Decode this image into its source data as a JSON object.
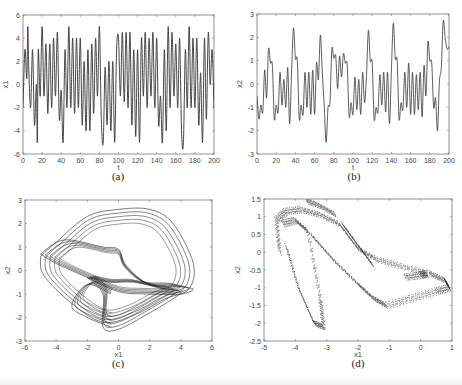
{
  "figure": {
    "captions": {
      "a": "(a)",
      "b": "(b)",
      "c": "(c)",
      "d": "(d)"
    }
  },
  "chart_data": [
    {
      "id": "a",
      "type": "line",
      "title": "",
      "xlabel": "t",
      "ylabel": "x1",
      "xlim": [
        0,
        200
      ],
      "ylim": [
        -6,
        6
      ],
      "xticks": [
        0,
        20,
        40,
        60,
        80,
        100,
        120,
        140,
        160,
        180,
        200
      ],
      "yticks": [
        -6,
        -4,
        -2,
        0,
        2,
        4,
        6
      ],
      "grid": false,
      "legend": null,
      "series": [
        {
          "name": "x1(t)",
          "x": [
            0,
            2,
            4,
            5,
            6,
            8,
            10,
            12,
            14,
            15,
            16,
            18,
            20,
            22,
            24,
            26,
            28,
            30,
            32,
            34,
            36,
            38,
            40,
            42,
            44,
            46,
            48,
            50,
            52,
            54,
            56,
            58,
            60,
            62,
            64,
            66,
            68,
            70,
            72,
            74,
            76,
            78,
            80,
            82,
            84,
            86,
            88,
            90,
            92,
            94,
            96,
            98,
            100,
            102,
            104,
            106,
            108,
            110,
            112,
            114,
            116,
            118,
            120,
            122,
            124,
            126,
            128,
            130,
            132,
            134,
            136,
            138,
            140,
            142,
            144,
            146,
            148,
            150,
            152,
            154,
            156,
            158,
            160,
            162,
            164,
            166,
            168,
            170,
            172,
            174,
            176,
            178,
            180,
            182,
            184,
            186,
            188,
            190,
            192,
            194,
            196,
            198,
            200
          ],
          "y": [
            -2,
            3,
            0.5,
            5,
            1.5,
            -2,
            3,
            -3.5,
            0,
            -5,
            3,
            -1,
            5,
            -1,
            3.5,
            -2.5,
            3.5,
            -2,
            4,
            -1,
            4.5,
            -3,
            -0.5,
            -5,
            3,
            -2,
            5,
            -2,
            4,
            -2.5,
            4,
            -2,
            4,
            -3.5,
            2,
            -4,
            3,
            -4,
            3.5,
            -2.5,
            4,
            -1,
            5,
            -3,
            -5,
            1.5,
            -3.5,
            2,
            -4,
            2,
            -5,
            3,
            4,
            -1,
            4.5,
            -1.5,
            4.5,
            -2,
            4.5,
            -3.5,
            3,
            -4.5,
            3,
            -5,
            4,
            -1,
            4.5,
            -2,
            4,
            -1,
            4.5,
            -2,
            4,
            -3.5,
            -1,
            -5,
            3,
            -4,
            5,
            -2,
            4.5,
            -1,
            3.5,
            -2,
            4,
            -4,
            -5,
            3,
            -2,
            5,
            -2,
            4,
            -2,
            4,
            -3.5,
            1,
            -5,
            4,
            -3,
            4.5,
            0,
            3,
            -2
          ]
        }
      ]
    },
    {
      "id": "b",
      "type": "line",
      "title": "",
      "xlabel": "t",
      "ylabel": "x2",
      "xlim": [
        0,
        200
      ],
      "ylim": [
        -3,
        3
      ],
      "xticks": [
        0,
        20,
        40,
        60,
        80,
        100,
        120,
        140,
        160,
        180,
        200
      ],
      "yticks": [
        -3,
        -2,
        -1,
        0,
        1,
        2,
        3
      ],
      "grid": false,
      "legend": null,
      "series": [
        {
          "name": "x2(t)",
          "x": [
            0,
            2,
            4,
            6,
            8,
            10,
            12,
            14,
            16,
            18,
            20,
            22,
            24,
            26,
            28,
            30,
            32,
            34,
            36,
            38,
            40,
            42,
            44,
            46,
            48,
            50,
            52,
            54,
            56,
            58,
            60,
            62,
            64,
            66,
            68,
            70,
            72,
            74,
            76,
            78,
            80,
            82,
            84,
            86,
            88,
            90,
            92,
            94,
            96,
            98,
            100,
            102,
            104,
            106,
            108,
            110,
            112,
            114,
            116,
            118,
            120,
            122,
            124,
            126,
            128,
            130,
            132,
            134,
            136,
            138,
            140,
            142,
            144,
            146,
            148,
            150,
            152,
            154,
            156,
            158,
            160,
            162,
            164,
            166,
            168,
            170,
            172,
            174,
            176,
            178,
            180,
            182,
            184,
            186,
            188,
            190,
            192,
            194,
            196,
            198,
            200
          ],
          "y": [
            -0.5,
            -1.5,
            -0.9,
            -1.2,
            0.6,
            -0.6,
            1.5,
            0.9,
            0.8,
            -1.5,
            -0.9,
            -1.2,
            0.5,
            -0.9,
            0.2,
            -1,
            0.7,
            -1.7,
            0.5,
            2.4,
            1.1,
            1,
            -1.5,
            -0.9,
            -1.3,
            0.5,
            -1,
            0.5,
            -1.3,
            0.6,
            -1.3,
            0.9,
            0.2,
            2.1,
            0.5,
            -0.9,
            -2.5,
            -1,
            -0.8,
            1.5,
            1.1,
            1.2,
            -0.2,
            1.2,
            0.3,
            1.3,
            0.9,
            0.8,
            -1.4,
            -0.8,
            -1.3,
            0.3,
            -1.1,
            0.2,
            -1.3,
            0.5,
            -0.8,
            0.3,
            2.3,
            1,
            0.9,
            -1.5,
            -1,
            -1.2,
            0.4,
            -0.9,
            0.5,
            -1.2,
            0.5,
            -1.7,
            0.6,
            2.6,
            1.1,
            1,
            -1.5,
            -0.8,
            -1.1,
            0.5,
            -1,
            0.9,
            -1.3,
            0.5,
            -1.3,
            0.4,
            -1.1,
            0.5,
            -1.4,
            0.8,
            -0.5,
            1.8,
            1,
            0.9,
            -1,
            -0.6,
            -2,
            0.1,
            0.7,
            2.7,
            2,
            1.5,
            1.6
          ]
        }
      ]
    },
    {
      "id": "c",
      "type": "line",
      "title": "",
      "xlabel": "x1",
      "ylabel": "x2",
      "xlim": [
        -6,
        6
      ],
      "ylim": [
        -3,
        3
      ],
      "xticks": [
        -6,
        -4,
        -2,
        0,
        2,
        4,
        6
      ],
      "yticks": [
        -3,
        -2,
        -1,
        0,
        1,
        2,
        3
      ],
      "grid": false,
      "legend": null,
      "description": "Phase portrait x2 vs x1 — chaotic multi-loop attractor spanning x1 ∈ [-5, 5], x2 ∈ [-2.5, 2.6]",
      "series": [
        {
          "name": "orbit-outer",
          "x": [
            -5,
            -4,
            -2,
            0,
            2,
            3.5,
            4.8,
            4.5,
            3,
            1,
            -1,
            -3,
            -4.8,
            -5
          ],
          "y": [
            0.6,
            1.2,
            2.3,
            2.6,
            2.6,
            2,
            0.3,
            -0.8,
            -1.2,
            -1.9,
            -2.2,
            -1.4,
            -0.2,
            0.6
          ]
        },
        {
          "name": "orbit-mid",
          "x": [
            -5,
            -3.5,
            -1,
            0,
            0.5,
            2,
            4,
            4.8,
            4,
            2,
            0,
            -2,
            -4,
            -5
          ],
          "y": [
            0.7,
            1.3,
            1,
            0.9,
            0.2,
            -0.6,
            -0.7,
            -0.8,
            -1,
            -1,
            -0.9,
            -0.3,
            0.3,
            0.7
          ]
        },
        {
          "name": "orbit-low",
          "x": [
            -2,
            -1,
            -1,
            0,
            2,
            3.5,
            4,
            3,
            1,
            -0.5,
            -2
          ],
          "y": [
            -0.3,
            -1,
            -2.4,
            -2.5,
            -1.8,
            -1.2,
            -0.9,
            -0.8,
            -0.5,
            -0.5,
            -0.3
          ]
        },
        {
          "name": "orbit-left-bulge",
          "x": [
            -0.5,
            -2,
            -3,
            -2,
            -0.5
          ],
          "y": [
            -1,
            -0.6,
            -1.5,
            -2,
            -2.4
          ]
        }
      ]
    },
    {
      "id": "d",
      "type": "scatter",
      "title": "",
      "xlabel": "x1",
      "ylabel": "x2",
      "xlim": [
        -5,
        1
      ],
      "ylim": [
        -2.5,
        1.5
      ],
      "xticks": [
        -5,
        -4,
        -3,
        -2,
        -1,
        0,
        1
      ],
      "yticks": [
        -2.5,
        -2,
        -1.5,
        -1,
        -0.5,
        0,
        0.5,
        1,
        1.5
      ],
      "grid": false,
      "legend": null,
      "description": "Poincaré-like point set forming a folded horseshoe band",
      "series": [
        {
          "name": "band-outer",
          "x": [
            -4.5,
            -4.6,
            -4.3,
            -3.8,
            -3.2,
            -2.6,
            -2,
            -1.4,
            -0.6,
            0.3,
            0.8,
            0.9
          ],
          "y": [
            0,
            0.9,
            1.15,
            1.2,
            1.05,
            0.8,
            0.1,
            -0.2,
            -0.4,
            -0.6,
            -0.8,
            -1
          ]
        },
        {
          "name": "band-inner-left",
          "x": [
            -4.4,
            -4,
            -3.6,
            -3.2,
            -3.1,
            -3.4,
            -3.9,
            -4.3
          ],
          "y": [
            0.8,
            0.9,
            0.6,
            -1.3,
            -2.1,
            -2,
            -1,
            0.2
          ]
        },
        {
          "name": "band-lower",
          "x": [
            -3.5,
            -2.8,
            -2,
            -1.5,
            -1.1,
            -0.3,
            0.5,
            0.9
          ],
          "y": [
            0.5,
            -0.2,
            -0.9,
            -1.3,
            -1.5,
            -1.3,
            -1.1,
            -1
          ]
        },
        {
          "name": "top-filament",
          "x": [
            -3.65,
            -3.2,
            -2.7
          ],
          "y": [
            1.45,
            1.3,
            1.05
          ]
        },
        {
          "name": "inner-tongue",
          "x": [
            -2.5,
            -2,
            -1.5
          ],
          "y": [
            0.8,
            0.2,
            -0.4
          ]
        },
        {
          "name": "right-tongue",
          "x": [
            -0.5,
            0,
            0.2
          ],
          "y": [
            -0.7,
            -0.65,
            -0.6
          ]
        }
      ]
    }
  ]
}
